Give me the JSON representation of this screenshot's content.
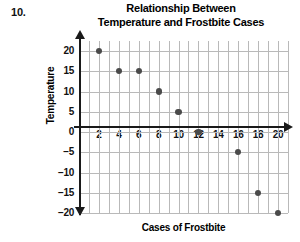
{
  "problem": {
    "number": "10."
  },
  "chart_data": {
    "type": "scatter",
    "title": "Relationship Between Temperature and Frostbite Cases",
    "title_line1": "Relationship Between",
    "title_line2": "Temperature and Frostbite Cases",
    "xlabel": "Cases of Frostbite",
    "ylabel": "Temperature",
    "xlim": [
      0,
      21
    ],
    "ylim": [
      -20,
      22.5
    ],
    "x_tick_labels": [
      "2",
      "4",
      "6",
      "8",
      "10",
      "12",
      "14",
      "16",
      "18",
      "20"
    ],
    "x_tick_values": [
      2,
      4,
      6,
      8,
      10,
      12,
      14,
      16,
      18,
      20
    ],
    "y_tick_labels": [
      "20",
      "15",
      "10",
      "5",
      "0",
      "−5",
      "−10",
      "−15",
      "−20"
    ],
    "y_tick_values": [
      20,
      15,
      10,
      5,
      0,
      -5,
      -10,
      -15,
      -20
    ],
    "grid": true,
    "grid_x_step": 1,
    "grid_y_step": 5,
    "legend": null,
    "points": [
      {
        "x": 2,
        "y": 20,
        "label": "(2, 20)"
      },
      {
        "x": 4,
        "y": 15,
        "label": "(4, 15)"
      },
      {
        "x": 6,
        "y": 15,
        "label": "(6, 15)"
      },
      {
        "x": 8,
        "y": 10,
        "label": "(8, 10)"
      },
      {
        "x": 10,
        "y": 5,
        "label": "(10, 5)"
      },
      {
        "x": 12,
        "y": 0,
        "label": "(12, 0)"
      },
      {
        "x": 16,
        "y": -5,
        "label": "(16, -5)"
      },
      {
        "x": 18,
        "y": -15,
        "label": "(18, -15)"
      },
      {
        "x": 20,
        "y": -20,
        "label": "(20, -20)"
      }
    ],
    "colors": {
      "point": "#4a4a4a",
      "grid": "#b9b9b9",
      "axis": "#1a1a1a",
      "text": "#000000",
      "background": "#ffffff"
    }
  }
}
